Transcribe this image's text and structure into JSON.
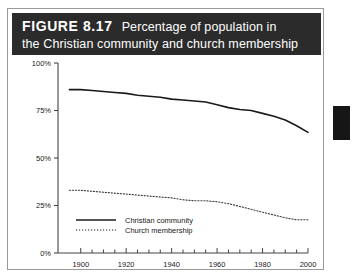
{
  "figure": {
    "label": "FIGURE 8.17",
    "title_line1": "Percentage of population in",
    "title_line2": "the Christian community and church membership",
    "band_color": "#2b2b2b",
    "border_color": "#9a9a9a"
  },
  "edge_tab": {
    "name": "page-edge-tab",
    "color": "#161616"
  },
  "chart_data": {
    "type": "line",
    "title": "Percentage of population in the Christian community and church membership",
    "xlabel": "",
    "ylabel": "",
    "xlim": [
      1890,
      2000
    ],
    "ylim": [
      0,
      100
    ],
    "grid": false,
    "legend_position": "inside-lower-left",
    "xticks": [
      1900,
      1920,
      1940,
      1960,
      1980,
      2000
    ],
    "xtick_labels": [
      "1900",
      "1920",
      "1940",
      "1960",
      "1980",
      "2000"
    ],
    "minor_tick_interval": 5,
    "yticks": [
      0,
      25,
      50,
      75,
      100
    ],
    "ytick_labels": [
      "0%",
      "25%",
      "50%",
      "75%",
      "100%"
    ],
    "series": [
      {
        "name": "Christian community",
        "style": "solid",
        "color": "#1a1a1a",
        "x": [
          1895,
          1900,
          1905,
          1910,
          1915,
          1920,
          1925,
          1930,
          1935,
          1940,
          1945,
          1950,
          1955,
          1960,
          1965,
          1970,
          1975,
          1980,
          1985,
          1990,
          1995,
          2000
        ],
        "values": [
          86,
          86,
          85.5,
          85,
          84.5,
          84,
          83,
          82.5,
          82,
          81,
          80.5,
          80,
          79.5,
          78,
          76.5,
          75.5,
          75,
          73.5,
          72,
          70,
          67,
          63.5
        ]
      },
      {
        "name": "Church membership",
        "style": "dotted",
        "color": "#3a3a3a",
        "x": [
          1895,
          1900,
          1905,
          1910,
          1915,
          1920,
          1925,
          1930,
          1935,
          1940,
          1945,
          1950,
          1955,
          1960,
          1965,
          1970,
          1975,
          1980,
          1985,
          1990,
          1995,
          2000
        ],
        "values": [
          33,
          33,
          32.5,
          32,
          31.5,
          31,
          30.5,
          30,
          29.5,
          29,
          28,
          27.5,
          27.5,
          27,
          26,
          24.5,
          23,
          21.5,
          20,
          18.5,
          17.5,
          17.5
        ]
      }
    ]
  },
  "legend": {
    "items": [
      {
        "label": "Christian community",
        "style": "solid"
      },
      {
        "label": "Church membership",
        "style": "dotted"
      }
    ]
  }
}
